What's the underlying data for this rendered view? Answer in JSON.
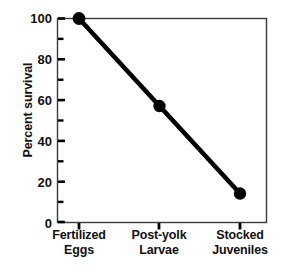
{
  "chart_data": {
    "type": "line",
    "title": "",
    "subtitle": "",
    "xlabel": "",
    "ylabel": "Percent survival",
    "categories": [
      "Fertilized Eggs",
      "Post-yolk Larvae",
      "Stocked Juveniles"
    ],
    "category_lines": [
      [
        "Fertilized",
        "Eggs"
      ],
      [
        "Post-yolk",
        "Larvae"
      ],
      [
        "Stocked",
        "Juveniles"
      ]
    ],
    "values": [
      100,
      57,
      14
    ],
    "series": [
      {
        "name": "Percent survival",
        "values": [
          100,
          57,
          14
        ]
      }
    ],
    "ylim": [
      0,
      100
    ],
    "y_major_ticks": [
      0,
      20,
      40,
      60,
      80,
      100
    ],
    "y_minor_ticks": [
      10,
      30,
      50,
      70,
      90
    ],
    "y_tick_labels": [
      "0",
      "20",
      "40",
      "60",
      "80",
      "100"
    ],
    "grid": false,
    "legend": "none",
    "marker": "filled-circle",
    "line_color": "#000000",
    "marker_color": "#000000",
    "frame_color": "#3a3a3a",
    "background_color": "#ffffff"
  }
}
